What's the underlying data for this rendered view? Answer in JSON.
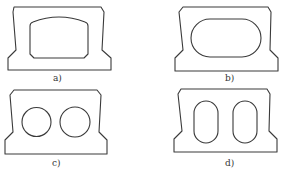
{
  "figure": {
    "type": "cross-section diagram",
    "stroke_color": "#3a3a3a",
    "background": "#ffffff",
    "panels": [
      {
        "id": "a",
        "label": "a)",
        "hole_shape": "single rectangular hole with arched top",
        "hole_count": 1
      },
      {
        "id": "b",
        "label": "b)",
        "hole_shape": "single stadium (rounded oval) hole",
        "hole_count": 1
      },
      {
        "id": "c",
        "label": "c)",
        "hole_shape": "circular holes",
        "hole_count": 2
      },
      {
        "id": "d",
        "label": "d)",
        "hole_shape": "vertical rounded slots",
        "hole_count": 2
      }
    ]
  }
}
